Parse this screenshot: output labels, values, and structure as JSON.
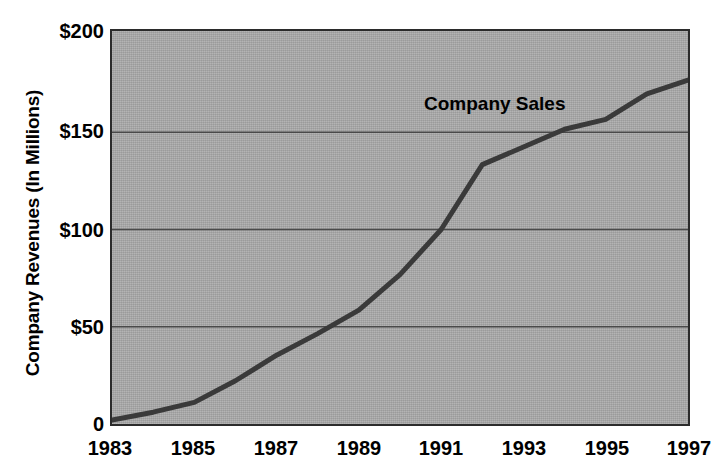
{
  "chart_data": {
    "type": "line",
    "title": "",
    "xlabel": "",
    "ylabel": "Company Revenues (In Millions)",
    "annotation": "Company Sales",
    "series_name": "Company Sales",
    "x": [
      1983,
      1984,
      1985,
      1986,
      1987,
      1988,
      1989,
      1990,
      1991,
      1992,
      1993,
      1994,
      1995,
      1996,
      1997
    ],
    "values": [
      2,
      6,
      11,
      22,
      35,
      46,
      58,
      76,
      99,
      132,
      141,
      150,
      155,
      168,
      175
    ],
    "xlim": [
      1983,
      1997
    ],
    "ylim": [
      0,
      200
    ],
    "ytick_values": [
      0,
      50,
      100,
      150,
      200
    ],
    "ytick_labels": [
      "0",
      "$50",
      "$100",
      "$150",
      "$200"
    ],
    "xtick_values": [
      1983,
      1985,
      1987,
      1989,
      1991,
      1993,
      1995,
      1997
    ],
    "xtick_labels": [
      "1983",
      "1985",
      "1987",
      "1989",
      "1991",
      "1993",
      "1995",
      "1997"
    ],
    "grid": "horizontal",
    "legend": "none",
    "plot_background_color": "#a9a9a9",
    "line_color": "#3a3a3a",
    "gridline_color": "#4a4a4a",
    "axis_color": "#2b2b2b"
  }
}
